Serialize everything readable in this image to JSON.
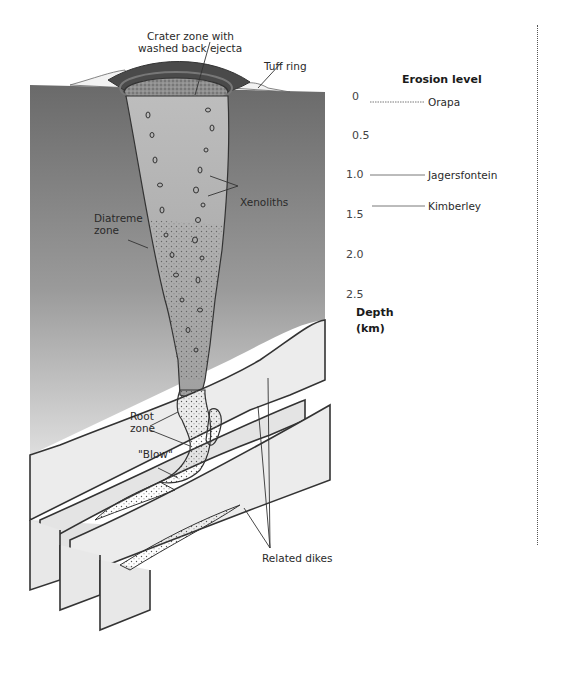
{
  "figure": {
    "title_labels": {
      "crater_zone": [
        "Crater zone with",
        "washed back ejecta"
      ],
      "tuff_ring": "Tuff ring",
      "diatreme_zone": [
        "Diatreme",
        "zone"
      ],
      "xenoliths": "Xenoliths",
      "root_zone": [
        "Root",
        "zone"
      ],
      "blow": "\"Blow\"",
      "related_dikes": "Related dikes"
    },
    "erosion_level": {
      "heading": "Erosion level",
      "levels": [
        {
          "name": "Orapa",
          "depth": "0"
        },
        {
          "name": "Jagersfontein",
          "depth": "1.0"
        },
        {
          "name": "Kimberley",
          "depth": "1.3"
        }
      ]
    },
    "depth_axis": {
      "ticks": [
        "0",
        "0.5",
        "1.0",
        "1.5",
        "2.0",
        "2.5"
      ],
      "label": [
        "Depth",
        "(km)"
      ]
    },
    "colors": {
      "ground_top": "#6e6e6e",
      "ground_bottom": "#d4d4d4",
      "pipe_fill": "#c8c8c8",
      "crater_rim": "#4a4a4a",
      "dike_fill": "#e8e8e8",
      "outline": "#333333"
    }
  }
}
